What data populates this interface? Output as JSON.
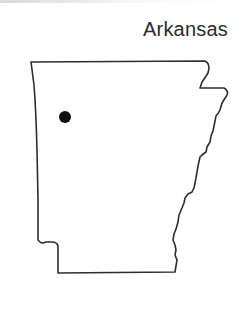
{
  "map": {
    "title": "Arkansas",
    "region": "Arkansas state outline",
    "marker": {
      "type": "location-dot",
      "color": "#111111",
      "position_px": [
        65,
        117
      ]
    },
    "colors": {
      "outline": "#2e2e2e",
      "fill": "#ffffff",
      "background": "#ffffff"
    }
  }
}
